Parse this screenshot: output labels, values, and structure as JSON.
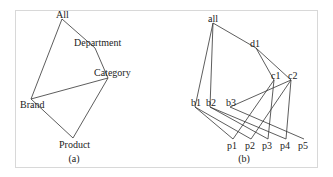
{
  "panels": [
    {
      "id": "a",
      "caption": "(a)",
      "nodes": [
        {
          "id": "All",
          "label": "All"
        },
        {
          "id": "Department",
          "label": "Department"
        },
        {
          "id": "Category",
          "label": "Category"
        },
        {
          "id": "Brand",
          "label": "Brand"
        },
        {
          "id": "Product",
          "label": "Product"
        }
      ],
      "edges": [
        [
          "All",
          "Department"
        ],
        [
          "Department",
          "Category"
        ],
        [
          "All",
          "Brand"
        ],
        [
          "Brand",
          "Category"
        ],
        [
          "Brand",
          "Product"
        ],
        [
          "Product",
          "Category"
        ]
      ]
    },
    {
      "id": "b",
      "caption": "(b)",
      "nodes": [
        {
          "id": "all",
          "label": "all"
        },
        {
          "id": "d1",
          "label": "d1"
        },
        {
          "id": "c1",
          "label": "c1"
        },
        {
          "id": "c2",
          "label": "c2"
        },
        {
          "id": "b1",
          "label": "b1"
        },
        {
          "id": "b2",
          "label": "b2"
        },
        {
          "id": "b3",
          "label": "b3"
        },
        {
          "id": "p1",
          "label": "p1"
        },
        {
          "id": "p2",
          "label": "p2"
        },
        {
          "id": "p3",
          "label": "p3"
        },
        {
          "id": "p4",
          "label": "p4"
        },
        {
          "id": "p5",
          "label": "p5"
        }
      ],
      "edges": [
        [
          "all",
          "d1"
        ],
        [
          "all",
          "b1"
        ],
        [
          "all",
          "b2"
        ],
        [
          "d1",
          "c1"
        ],
        [
          "d1",
          "c2"
        ],
        [
          "c2",
          "b3"
        ],
        [
          "c1",
          "p1"
        ],
        [
          "c1",
          "p3"
        ],
        [
          "c2",
          "p2"
        ],
        [
          "c2",
          "p4"
        ],
        [
          "b1",
          "p1"
        ],
        [
          "b1",
          "p2"
        ],
        [
          "b2",
          "p3"
        ],
        [
          "b2",
          "p4"
        ],
        [
          "b3",
          "p5"
        ]
      ]
    }
  ]
}
